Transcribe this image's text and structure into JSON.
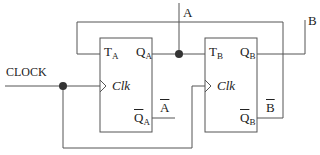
{
  "diagram": {
    "type": "circuit",
    "inputs": {
      "clock": "CLOCK"
    },
    "outputs": {
      "a": "A",
      "b": "B",
      "a_bar": "A",
      "b_bar": "B"
    },
    "flipflops": [
      {
        "id": "A",
        "t_label": "T",
        "t_sub": "A",
        "q_label": "Q",
        "q_sub": "A",
        "clk_label": "Clk",
        "qbar_label": "Q",
        "qbar_sub": "A"
      },
      {
        "id": "B",
        "t_label": "T",
        "t_sub": "B",
        "q_label": "Q",
        "q_sub": "B",
        "clk_label": "Clk",
        "qbar_label": "Q",
        "qbar_sub": "B"
      }
    ],
    "colors": {
      "wire": "#555555",
      "junction": "#333333",
      "text": "#222222"
    }
  }
}
